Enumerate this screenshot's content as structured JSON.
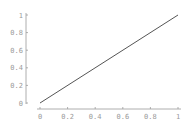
{
  "chart_data": {
    "type": "line",
    "title": "",
    "xlabel": "",
    "ylabel": "",
    "xlim": [
      0,
      1
    ],
    "ylim": [
      0,
      1
    ],
    "grid": false,
    "legend": null,
    "x_ticks": [
      "0",
      "0.2",
      "0.4",
      "0.6",
      "0.8",
      "1"
    ],
    "y_ticks": [
      "0",
      "0.2",
      "0.4",
      "0.6",
      "0.8",
      "1"
    ],
    "series": [
      {
        "name": "y = x",
        "x": [
          0,
          1
        ],
        "y": [
          0,
          1
        ],
        "color": "#555555"
      }
    ]
  },
  "colors": {
    "axis": "#9a9a9a",
    "line": "#555555",
    "background": "#ffffff"
  }
}
